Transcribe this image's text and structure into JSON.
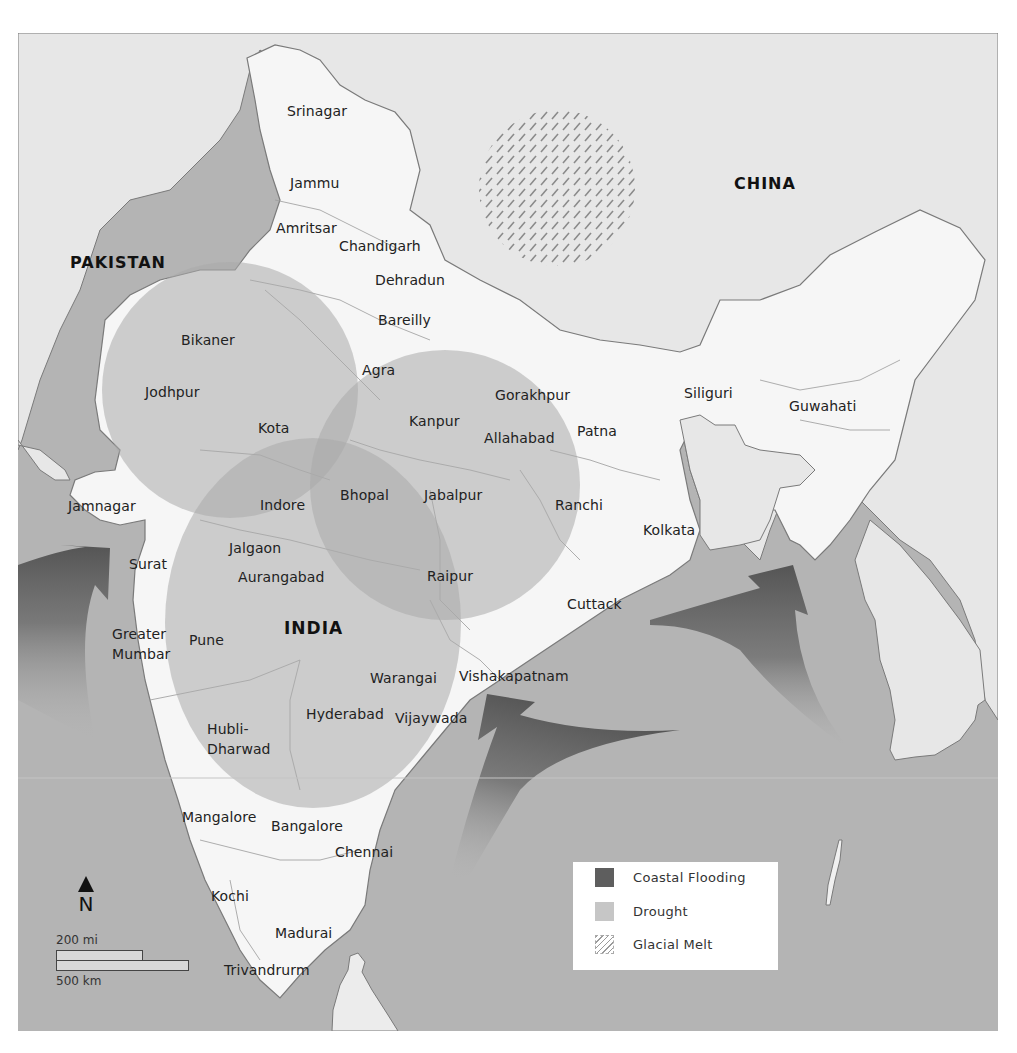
{
  "map": {
    "countries": [
      {
        "name": "PAKISTAN",
        "x": 70,
        "y": 253
      },
      {
        "name": "CHINA",
        "x": 734,
        "y": 174
      },
      {
        "name": "INDIA",
        "x": 284,
        "y": 618
      }
    ],
    "cities": [
      {
        "name": "Srinagar",
        "x": 287,
        "y": 103
      },
      {
        "name": "Jammu",
        "x": 290,
        "y": 175
      },
      {
        "name": "Amritsar",
        "x": 276,
        "y": 220
      },
      {
        "name": "Chandigarh",
        "x": 339,
        "y": 238
      },
      {
        "name": "Dehradun",
        "x": 375,
        "y": 272
      },
      {
        "name": "Bareilly",
        "x": 378,
        "y": 312
      },
      {
        "name": "Bikaner",
        "x": 181,
        "y": 332
      },
      {
        "name": "Jodhpur",
        "x": 145,
        "y": 384
      },
      {
        "name": "Agra",
        "x": 362,
        "y": 362
      },
      {
        "name": "Gorakhpur",
        "x": 495,
        "y": 387
      },
      {
        "name": "Siliguri",
        "x": 684,
        "y": 385
      },
      {
        "name": "Guwahati",
        "x": 789,
        "y": 398
      },
      {
        "name": "Kanpur",
        "x": 409,
        "y": 413
      },
      {
        "name": "Kota",
        "x": 258,
        "y": 420
      },
      {
        "name": "Allahabad",
        "x": 484,
        "y": 430
      },
      {
        "name": "Patna",
        "x": 577,
        "y": 423
      },
      {
        "name": "Jamnagar",
        "x": 68,
        "y": 498
      },
      {
        "name": "Indore",
        "x": 260,
        "y": 497
      },
      {
        "name": "Bhopal",
        "x": 340,
        "y": 487
      },
      {
        "name": "Jabalpur",
        "x": 424,
        "y": 487
      },
      {
        "name": "Ranchi",
        "x": 555,
        "y": 497
      },
      {
        "name": "Kolkata",
        "x": 643,
        "y": 522
      },
      {
        "name": "Jalgaon",
        "x": 229,
        "y": 540
      },
      {
        "name": "Surat",
        "x": 129,
        "y": 556
      },
      {
        "name": "Aurangabad",
        "x": 238,
        "y": 569
      },
      {
        "name": "Raipur",
        "x": 427,
        "y": 568
      },
      {
        "name": "Cuttack",
        "x": 567,
        "y": 596
      },
      {
        "name": "Greater",
        "x": 112,
        "y": 626
      },
      {
        "name": "Mumbar",
        "x": 112,
        "y": 646
      },
      {
        "name": "Pune",
        "x": 189,
        "y": 632
      },
      {
        "name": "Warangai",
        "x": 370,
        "y": 670
      },
      {
        "name": "Vishakapatnam",
        "x": 459,
        "y": 668
      },
      {
        "name": "Hyderabad",
        "x": 306,
        "y": 706
      },
      {
        "name": "Vijaywada",
        "x": 395,
        "y": 710
      },
      {
        "name": "Hubli-",
        "x": 207,
        "y": 721
      },
      {
        "name": "Dharwad",
        "x": 207,
        "y": 741
      },
      {
        "name": "Mangalore",
        "x": 182,
        "y": 809
      },
      {
        "name": "Bangalore",
        "x": 271,
        "y": 818
      },
      {
        "name": "Chennai",
        "x": 335,
        "y": 844
      },
      {
        "name": "Kochi",
        "x": 211,
        "y": 888
      },
      {
        "name": "Madurai",
        "x": 275,
        "y": 925
      },
      {
        "name": "Trivandrurm",
        "x": 224,
        "y": 962
      }
    ]
  },
  "legend": {
    "items": [
      {
        "label": "Coastal Flooding",
        "color": "#5e5e5e",
        "pattern": "solid"
      },
      {
        "label": "Drought",
        "color": "#c6c6c6",
        "pattern": "solid"
      },
      {
        "label": "Glacial Melt",
        "color": "#9a9a9a",
        "pattern": "hatch"
      }
    ]
  },
  "compass": {
    "letter": "N"
  },
  "scale": {
    "miles_label": "200 mi",
    "km_label": "500 km"
  },
  "colors": {
    "land_foreign": "#e7e7e7",
    "land_india": "#f6f6f6",
    "sea": "#b4b4b4",
    "drought": "#b9b9b9",
    "coastal_flooding": "#5e5e5e",
    "border": "#7a7a7a"
  }
}
